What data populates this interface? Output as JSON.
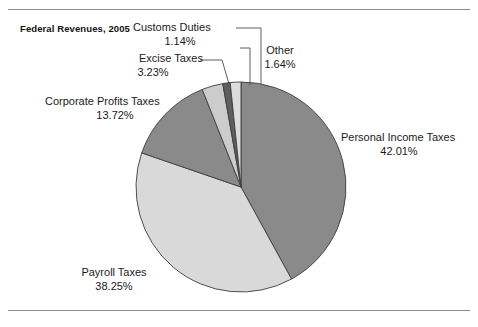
{
  "figure": {
    "title": "Federal Revenues, 2005",
    "rules": {
      "top": true,
      "bottom": true
    },
    "background": "#ffffff"
  },
  "chart_data": {
    "type": "pie",
    "title": "Federal Revenues, 2005",
    "xlabel": "",
    "ylabel": "",
    "units": "percent",
    "start_angle_deg": 0,
    "direction": "clockwise",
    "legend": "none (direct labels with leader lines)",
    "grid": false,
    "categories": [
      "Personal Income Taxes",
      "Payroll Taxes",
      "Corporate Profits Taxes",
      "Excise Taxes",
      "Customs Duties",
      "Other"
    ],
    "values": [
      42.01,
      38.25,
      13.72,
      3.23,
      1.14,
      1.64
    ],
    "slices": [
      {
        "label": "Personal Income Taxes",
        "value": 42.01,
        "value_text": "42.01%",
        "color": "#8a8a8a"
      },
      {
        "label": "Payroll Taxes",
        "value": 38.25,
        "value_text": "38.25%",
        "color": "#d9d9d9"
      },
      {
        "label": "Corporate Profits Taxes",
        "value": 13.72,
        "value_text": "13.72%",
        "color": "#8a8a8a"
      },
      {
        "label": "Excise Taxes",
        "value": 3.23,
        "value_text": "3.23%",
        "color": "#cccccc"
      },
      {
        "label": "Customs Duties",
        "value": 1.14,
        "value_text": "1.14%",
        "color": "#5e5e5e"
      },
      {
        "label": "Other",
        "value": 1.64,
        "value_text": "1.64%",
        "color": "#dcdcdc"
      }
    ]
  },
  "labels": {
    "customs_duties": {
      "name": "Customs Duties",
      "value": "1.14%"
    },
    "other": {
      "name": "Other",
      "value": "1.64%"
    },
    "excise_taxes": {
      "name": "Excise Taxes",
      "value": "3.23%"
    },
    "corporate_profits_taxes": {
      "name": "Corporate Profits Taxes",
      "value": "13.72%"
    },
    "personal_income_taxes": {
      "name": "Personal Income Taxes",
      "value": "42.01%"
    },
    "payroll_taxes": {
      "name": "Payroll Taxes",
      "value": "38.25%"
    }
  }
}
